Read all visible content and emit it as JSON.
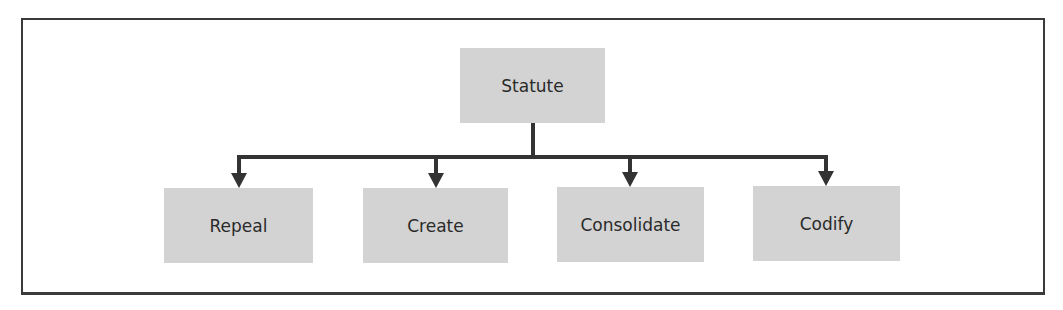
{
  "diagram": {
    "type": "hierarchy",
    "root": {
      "label": "Statute"
    },
    "children": [
      {
        "label": "Repeal"
      },
      {
        "label": "Create"
      },
      {
        "label": "Consolidate"
      },
      {
        "label": "Codify"
      }
    ],
    "colors": {
      "box_fill": "#d3d3d3",
      "line": "#333333",
      "frame": "#3a3a3a",
      "text": "#2a2a2a"
    }
  }
}
